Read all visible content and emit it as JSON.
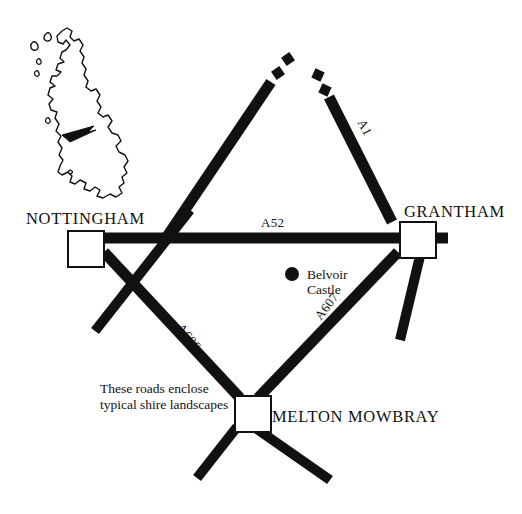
{
  "figure": {
    "type": "schematic-road-map",
    "region": "East Midlands, England",
    "background_color": "#ffffff",
    "road_color": "#111111",
    "marker_fill": "#ffffff",
    "marker_stroke": "#111111"
  },
  "inset": {
    "name": "uk-outline-inset",
    "description": "Outline map of Great Britain with arrow pointing to the East Midlands",
    "arrow": "pointer-arrow"
  },
  "cities": [
    {
      "id": "nottingham",
      "label": "NOTTINGHAM",
      "marker": "white-square",
      "label_x": 26,
      "label_y": 210,
      "marker_x": 68,
      "marker_y": 231,
      "marker_size": 36
    },
    {
      "id": "grantham",
      "label": "GRANTHAM",
      "marker": "white-square",
      "label_x": 404,
      "label_y": 203,
      "marker_x": 400,
      "marker_y": 222,
      "marker_size": 36
    },
    {
      "id": "melton-mowbray",
      "label": "MELTON MOWBRAY",
      "marker": "white-square",
      "label_x": 272,
      "label_y": 408,
      "marker_x": 235,
      "marker_y": 396,
      "marker_size": 36
    }
  ],
  "points_of_interest": [
    {
      "id": "belvoir-castle",
      "label_line1": "Belvoir",
      "label_line2": "Castle",
      "marker": "black-dot",
      "dot_x": 292,
      "dot_y": 274,
      "dot_radius": 7,
      "label_x": 307,
      "label_y": 267
    }
  ],
  "roads": [
    {
      "id": "a52",
      "label": "A52",
      "label_x": 261,
      "label_y": 216,
      "orientation": "horizontal",
      "from": "nottingham",
      "to": "grantham"
    },
    {
      "id": "a1",
      "label": "A1",
      "label_x": 367,
      "label_y": 117,
      "orientation": "diagonal-rotated",
      "note": "continues off map to the north, shown dashed"
    },
    {
      "id": "a606",
      "label": "A606",
      "label_x": 185,
      "label_y": 321,
      "orientation": "diagonal-rotated",
      "from": "nottingham",
      "to": "melton-mowbray"
    },
    {
      "id": "a607",
      "label": "A607",
      "label_x": 312,
      "label_y": 314,
      "orientation": "diagonal-rotated",
      "from": "grantham",
      "to": "melton-mowbray"
    }
  ],
  "annotations": [
    {
      "id": "shire-caption",
      "line1": "These roads enclose",
      "line2": "typical shire landscapes",
      "x": 100,
      "y": 381
    }
  ]
}
